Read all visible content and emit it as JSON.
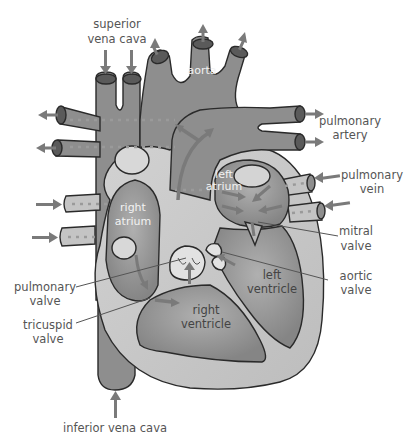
{
  "diagram": {
    "labels": {
      "superior_vena_cava": [
        "superior",
        "vena cava"
      ],
      "aorta": "aorta",
      "pulmonary_artery": [
        "pulmonary",
        "artery"
      ],
      "pulmonary_vein": [
        "pulmonary",
        "vein"
      ],
      "left_atrium": [
        "left",
        "atrium"
      ],
      "right_atrium": [
        "right",
        "atrium"
      ],
      "mitral_valve": [
        "mitral",
        "valve"
      ],
      "aortic_valve": [
        "aortic",
        "valve"
      ],
      "left_ventricle": [
        "left",
        "ventricle"
      ],
      "right_ventricle": [
        "right",
        "ventricle"
      ],
      "pulmonary_valve": [
        "pulmonary",
        "valve"
      ],
      "tricuspid_valve": [
        "tricuspid",
        "valve"
      ],
      "inferior_vena_cava": "inferior vena cava"
    },
    "colors": {
      "vessel": "#8c8c8c",
      "heart_wall": "#c8c8c8",
      "chamber": "#9a9a9a",
      "valve": "#e0e0e0",
      "outline": "#2a2a2a",
      "arrow": "#7a7a7a",
      "label_text": "#555555",
      "inner_label_text": "#f2f2f2"
    }
  }
}
